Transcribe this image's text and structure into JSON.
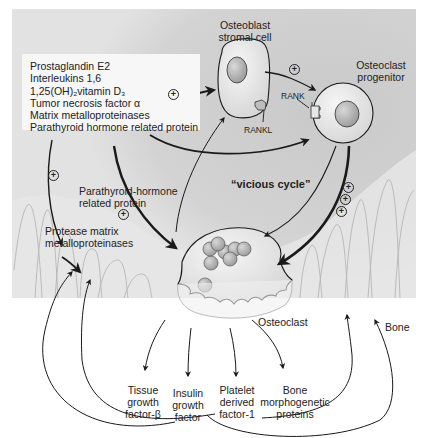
{
  "figure": {
    "cells": {
      "osteoblast": "Osteoblast",
      "stromal_cell": "stromal cell",
      "osteoclast_line1": "Osteoclast",
      "osteoclast_line2": "progenitor",
      "osteoclast": "Osteoclast",
      "rankl": "RANKL",
      "rank": "RANK"
    },
    "tumor_factors": [
      "Prostaglandin E2",
      "Interleukins 1,6",
      "1,25(OH)₂vitamin D₃",
      "Tumor necrosis factor α",
      "Matrix metalloproteinases",
      "Parathyroid hormone related protein"
    ],
    "pthrp_line1": "Parathyroid-hormone",
    "pthrp_line2": "related protein",
    "protease_line1": "Protease matrix",
    "protease_line2": "metalloproteinases",
    "vicious_cycle": "“vicious cycle”",
    "bone": "Bone",
    "plus_symbol": "+",
    "released_factors": [
      {
        "lines": [
          "Tissue",
          "growth",
          "factor-β"
        ]
      },
      {
        "lines": [
          "Insulin",
          "growth",
          "factor"
        ]
      },
      {
        "lines": [
          "Platelet",
          "derived",
          "factor-1"
        ]
      },
      {
        "lines": [
          "Bone",
          "morphogenetic",
          "proteins"
        ]
      }
    ]
  },
  "colors": {
    "background_gray": "#d8d8d8",
    "light_gray": "#ececec",
    "cell_fill": "#e9e9e9",
    "nucleus": "#b8b8b8",
    "arrow": "#1a1a1a"
  }
}
